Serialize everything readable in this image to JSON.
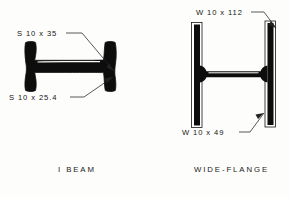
{
  "sheet": {
    "background_color": "#fdfdfb",
    "ink_color": "#111111"
  },
  "figures": [
    {
      "id": "i-beam",
      "caption": "I  BEAM",
      "caption_x": 58,
      "caption_y": 172,
      "callouts": [
        {
          "id": "s-10x35",
          "text": "S 10 x 35",
          "text_x": 17,
          "text_y": 36,
          "leader_path": "M 66 33 L 82 33 L 114 71",
          "arrow_points": "114,71 106.5,67.5 109,63"
        },
        {
          "id": "s-10x25-4",
          "text": "S 10 x 25.4",
          "text_x": 9,
          "text_y": 100,
          "leader_path": "M 70 97 L 84 97 L 113 77",
          "arrow_points": "113,77 104.5,78.5 107,83"
        }
      ]
    },
    {
      "id": "wide-flange",
      "caption": "WIDE-FLANGE",
      "caption_x": 194,
      "caption_y": 172,
      "callouts": [
        {
          "id": "w-10x112",
          "text": "W 10 x 112",
          "text_x": 196,
          "text_y": 15,
          "leader_path": "M 251 12 L 264 12 L 276 28",
          "arrow_points": "276,28 268.5,25 271,21"
        },
        {
          "id": "w-10x49",
          "text": "W 10 x 49",
          "text_x": 182,
          "text_y": 135,
          "leader_path": "M 239 132 L 250 132 L 264 113",
          "arrow_points": "264,113 255.5,114.5 258,119"
        }
      ]
    }
  ],
  "colors": {
    "beam_fill": "#0d0d0d",
    "outline": "#111111",
    "leader": "#222222",
    "paper": "#fdfdfb"
  }
}
